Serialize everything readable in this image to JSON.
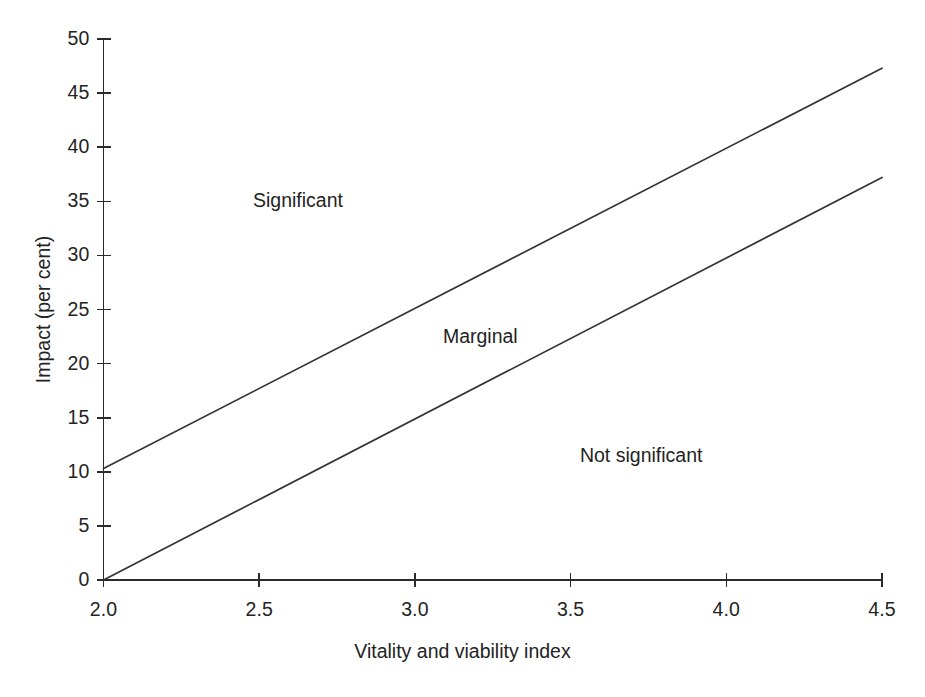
{
  "chart_data": {
    "type": "line",
    "title": "",
    "xlabel": "Vitality and viability index",
    "ylabel": "Impact (per cent)",
    "xlim": [
      2.0,
      4.5
    ],
    "ylim": [
      0,
      50
    ],
    "grid": false,
    "legend": "none",
    "xticks": [
      "2.0",
      "2.5",
      "3.0",
      "3.5",
      "4.0",
      "4.5"
    ],
    "xtick_values": [
      2.0,
      2.5,
      3.0,
      3.5,
      4.0,
      4.5
    ],
    "yticks": [
      "0",
      "5",
      "10",
      "15",
      "20",
      "25",
      "30",
      "35",
      "40",
      "45",
      "50"
    ],
    "ytick_values": [
      0,
      5,
      10,
      15,
      20,
      25,
      30,
      35,
      40,
      45,
      50
    ],
    "series": [
      {
        "name": "upper-boundary",
        "x": [
          2.0,
          4.5
        ],
        "values": [
          10.3,
          47.3
        ]
      },
      {
        "name": "lower-boundary",
        "x": [
          2.0,
          4.5
        ],
        "values": [
          0.0,
          37.2
        ]
      }
    ],
    "annotations": [
      {
        "text": "Significant",
        "x": 2.48,
        "y": 35.0
      },
      {
        "text": "Marginal",
        "x": 3.09,
        "y": 22.5
      },
      {
        "text": "Not significant",
        "x": 3.53,
        "y": 11.5
      }
    ],
    "line_color": "#333333",
    "axis_color": "#2b2b2b",
    "background_color": "#ffffff"
  }
}
